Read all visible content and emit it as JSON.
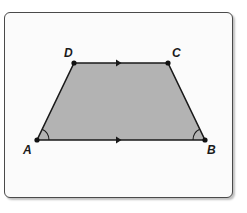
{
  "figure": {
    "type": "trapezoid",
    "fill_color": "#b3b3b3",
    "stroke_color": "#1a1a1a",
    "card_background": "#fbfbfb",
    "card_border": "#4a4a4a"
  },
  "vertices": {
    "A": {
      "label": "A",
      "x": 37,
      "y": 140
    },
    "B": {
      "label": "B",
      "x": 205,
      "y": 140
    },
    "C": {
      "label": "C",
      "x": 168,
      "y": 63
    },
    "D": {
      "label": "D",
      "x": 74,
      "y": 63
    }
  },
  "labels": {
    "A": "A",
    "B": "B",
    "C": "C",
    "D": "D"
  },
  "markings": {
    "parallel_arrows": [
      "DC",
      "AB"
    ],
    "congruent_angles": [
      "A",
      "B"
    ]
  }
}
